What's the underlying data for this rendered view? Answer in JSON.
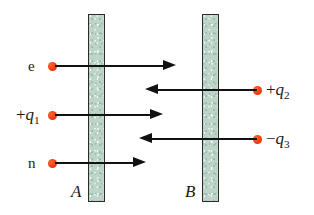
{
  "figure": {
    "type": "physics-diagram",
    "background_color": "#ffffff",
    "plate_fill_color": "#bcd5c8",
    "plate_border_color": "#2b2b2b",
    "particle_color": "#f33c10",
    "arrow_color": "#121212"
  },
  "plates": [
    {
      "id": "plate-a",
      "label": "A",
      "label_x": 71,
      "label_y": 183,
      "x": 88,
      "y": 14,
      "width": 17,
      "height": 188
    },
    {
      "id": "plate-b",
      "label": "B",
      "label_x": 185,
      "label_y": 183,
      "x": 202,
      "y": 14,
      "width": 17,
      "height": 188
    }
  ],
  "particles": [
    {
      "id": "particle-e",
      "label": "e",
      "label_kind": "upright",
      "sign": "",
      "symbol": "e",
      "subscript": "",
      "direction": "right",
      "dot_x": 48,
      "dot_y": 62,
      "label_x": 28,
      "label_y": 59,
      "line_x": 55,
      "line_y": 65,
      "line_width": 108,
      "head_x": 163,
      "head_y": 60
    },
    {
      "id": "particle-q2",
      "label": "+q2",
      "label_kind": "charge",
      "sign": "+",
      "symbol": "q",
      "subscript": "2",
      "direction": "left",
      "dot_x": 253,
      "dot_y": 86,
      "label_x": 266,
      "label_y": 81,
      "line_x": 158,
      "line_y": 89,
      "line_width": 99,
      "head_x": 145,
      "head_y": 84
    },
    {
      "id": "particle-q1",
      "label": "+q1",
      "label_kind": "charge",
      "sign": "+",
      "symbol": "q",
      "subscript": "1",
      "direction": "right",
      "dot_x": 48,
      "dot_y": 111,
      "label_x": 16,
      "label_y": 106,
      "line_x": 55,
      "line_y": 114,
      "line_width": 95,
      "head_x": 150,
      "head_y": 109
    },
    {
      "id": "particle-q3",
      "label": "-q3",
      "label_kind": "charge",
      "sign": "−",
      "symbol": "q",
      "subscript": "3",
      "direction": "left",
      "dot_x": 253,
      "dot_y": 135,
      "label_x": 266,
      "label_y": 130,
      "line_x": 152,
      "line_y": 138,
      "line_width": 105,
      "head_x": 139,
      "head_y": 133
    },
    {
      "id": "particle-n",
      "label": "n",
      "label_kind": "upright",
      "sign": "",
      "symbol": "n",
      "subscript": "",
      "direction": "right",
      "dot_x": 48,
      "dot_y": 159,
      "label_x": 28,
      "label_y": 156,
      "line_x": 55,
      "line_y": 162,
      "line_width": 78,
      "head_x": 133,
      "head_y": 157
    }
  ]
}
